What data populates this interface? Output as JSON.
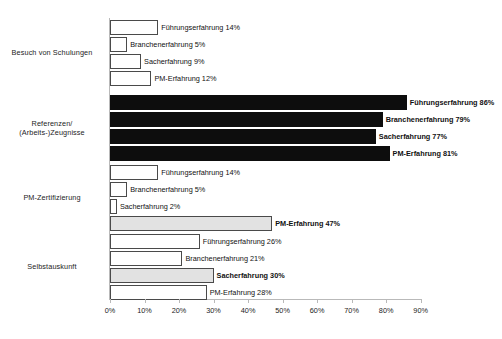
{
  "chart_data": {
    "type": "bar",
    "orientation": "horizontal",
    "title": "",
    "xlabel": "",
    "ylabel": "",
    "xlim": [
      0,
      95
    ],
    "grid": false,
    "legend": "none",
    "tick_labels": [
      "0%",
      "10%",
      "20%",
      "30%",
      "40%",
      "50%",
      "60%",
      "70%",
      "80%",
      "90%"
    ],
    "tick_values": [
      0,
      10,
      20,
      30,
      40,
      50,
      60,
      70,
      80,
      90
    ],
    "categories": [
      "Besuch von Schulungen",
      "Referenzen/ (Arbeits-)Zeugnisse",
      "PM-Zertifizierung",
      "Selbstauskunft"
    ],
    "series": [
      {
        "name": "Führungserfahrung",
        "values": [
          14,
          86,
          14,
          26
        ]
      },
      {
        "name": "Branchenerfahrung",
        "values": [
          5,
          79,
          5,
          21
        ]
      },
      {
        "name": "Sacherfahrung",
        "values": [
          9,
          77,
          2,
          30
        ]
      },
      {
        "name": "PM-Erfahrung",
        "values": [
          12,
          81,
          47,
          28
        ]
      }
    ],
    "groups": [
      {
        "label_lines": [
          "Besuch von Schulungen"
        ],
        "bars": [
          {
            "label": "Führungserfahrung 14%",
            "value": 14,
            "fill": "white",
            "bold": false
          },
          {
            "label": "Branchenerfahrung 5%",
            "value": 5,
            "fill": "white",
            "bold": false
          },
          {
            "label": "Sacherfahrung 9%",
            "value": 9,
            "fill": "white",
            "bold": false
          },
          {
            "label": "PM-Erfahrung 12%",
            "value": 12,
            "fill": "white",
            "bold": false
          }
        ]
      },
      {
        "label_lines": [
          "Referenzen/",
          "(Arbeits-)Zeugnisse"
        ],
        "bars": [
          {
            "label": "Führungserfahrung 86%",
            "value": 86,
            "fill": "black",
            "bold": true
          },
          {
            "label": "Branchenerfahrung 79%",
            "value": 79,
            "fill": "black",
            "bold": true
          },
          {
            "label": "Sacherfahrung 77%",
            "value": 77,
            "fill": "black",
            "bold": true
          },
          {
            "label": "PM-Erfahrung 81%",
            "value": 81,
            "fill": "black",
            "bold": true
          }
        ]
      },
      {
        "label_lines": [
          "PM-Zertifizierung"
        ],
        "bars": [
          {
            "label": "Führungserfahrung 14%",
            "value": 14,
            "fill": "white",
            "bold": false
          },
          {
            "label": "Branchenerfahrung 5%",
            "value": 5,
            "fill": "white",
            "bold": false
          },
          {
            "label": "Sacherfahrung 2%",
            "value": 2,
            "fill": "white",
            "bold": false
          },
          {
            "label": "PM-Erfahrung 47%",
            "value": 47,
            "fill": "gray",
            "bold": true
          }
        ]
      },
      {
        "label_lines": [
          "Selbstauskunft"
        ],
        "bars": [
          {
            "label": "Führungserfahrung 26%",
            "value": 26,
            "fill": "white",
            "bold": false
          },
          {
            "label": "Branchenerfahrung 21%",
            "value": 21,
            "fill": "white",
            "bold": false
          },
          {
            "label": "Sacherfahrung 30%",
            "value": 30,
            "fill": "gray",
            "bold": true
          },
          {
            "label": "PM-Erfahrung 28%",
            "value": 28,
            "fill": "white",
            "bold": false
          }
        ]
      }
    ],
    "colors": {
      "bar_white": "#ffffff",
      "bar_gray": "#e2e2e2",
      "bar_black": "#0d0d0d",
      "bar_outline": "#4a4a4a",
      "axis": "#b9b9b9",
      "text": "#111111",
      "background": "#ffffff"
    }
  }
}
